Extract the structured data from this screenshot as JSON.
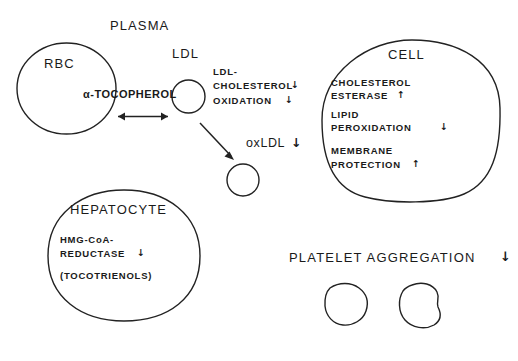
{
  "diagram": {
    "title_plasma": "PLASMA",
    "compartments": {
      "rbc": {
        "label": "RBC",
        "content": "α-TOCOPHEROL"
      },
      "ldl": {
        "label": "LDL"
      },
      "cell": {
        "label": "CELL",
        "lines": [
          {
            "text": "CHOLESTEROL",
            "arrow": ""
          },
          {
            "text": "ESTERASE",
            "arrow": "↑"
          },
          {
            "text": "LIPID",
            "arrow": ""
          },
          {
            "text": "PEROXIDATION",
            "arrow": "↓"
          },
          {
            "text": "MEMBRANE",
            "arrow": ""
          },
          {
            "text": "PROTECTION",
            "arrow": "↑"
          }
        ]
      },
      "hepatocyte": {
        "label": "HEPATOCYTE",
        "lines": [
          {
            "text": "HMG-CoA-",
            "arrow": ""
          },
          {
            "text": "REDUCTASE",
            "arrow": "↓"
          },
          {
            "text": "(TOCOTRIENOLS)",
            "arrow": ""
          }
        ]
      }
    },
    "plasma_annotations": {
      "line1": "LDL-",
      "line2": "CHOLESTEROL",
      "line2_arrow": "↓",
      "line3": "OXIDATION",
      "line3_arrow": "↓",
      "oxldl": "oxLDL",
      "oxldl_arrow": "↓"
    },
    "platelet": {
      "label": "PLATELET AGGREGATION",
      "arrow": "↓"
    },
    "colors": {
      "ink": "#1a1a1a",
      "stroke": "#222222",
      "background": "#ffffff"
    }
  }
}
